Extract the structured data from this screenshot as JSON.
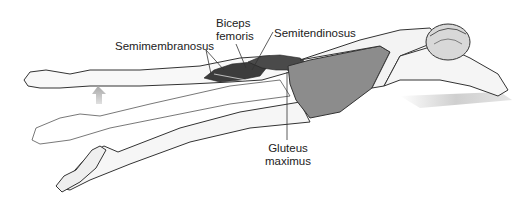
{
  "figure": {
    "colors": {
      "background": "#ffffff",
      "outline": "#333333",
      "skin": "#f4f4f4",
      "swimsuit": "#8c8c8c",
      "muscle_dark": "#3a3a3a",
      "muscle_mid": "#5a5a5a",
      "arrow": "#b5b5b5",
      "shadow": "#d8d8d8"
    }
  },
  "labels": {
    "semimembranosus": "Semimembranosus",
    "biceps_femoris_line1": "Biceps",
    "biceps_femoris_line2": "femoris",
    "semitendinosus": "Semitendinosus",
    "gluteus_maximus_line1": "Gluteus",
    "gluteus_maximus_line2": "maximus"
  },
  "indicators": {
    "movement_arrow": "up-arrow"
  }
}
